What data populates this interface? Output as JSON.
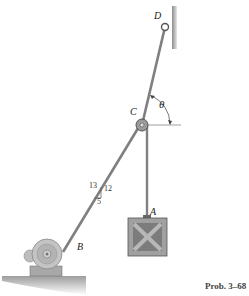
{
  "figure": {
    "labels": {
      "D": "D",
      "C": "C",
      "theta": "θ",
      "A": "A",
      "B": "B"
    },
    "slope": {
      "hyp": "13",
      "vert": "12",
      "horiz": "5"
    },
    "caption": "Prob. 3–68"
  },
  "colors": {
    "rope": "#8a8a8a",
    "wall": "#9a9a9a",
    "crate": "#8c8c8c",
    "motor": "#b5b5b5",
    "ground": "#a9a9a9"
  }
}
